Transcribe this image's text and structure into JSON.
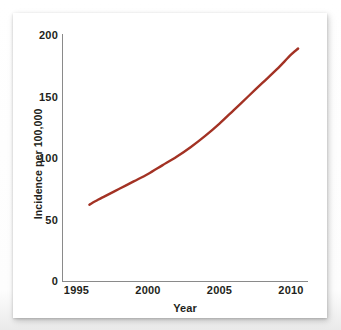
{
  "figure": {
    "background_color": "#ffffff",
    "card_color": "#ffffff",
    "axis_color": "#8a8a8a",
    "text_color": "#231f20"
  },
  "chart_data": {
    "type": "line",
    "title": "",
    "subtitle": "",
    "xlabel": "Year",
    "ylabel": "Incidence per 100,000",
    "xlim": [
      1995,
      2010.8
    ],
    "ylim": [
      0,
      200
    ],
    "xticks": [
      "1995",
      "2000",
      "2005",
      "2010"
    ],
    "xtick_values": [
      1995,
      2000,
      2005,
      2010
    ],
    "yticks": [
      "0",
      "50",
      "100",
      "150",
      "200"
    ],
    "ytick_values": [
      0,
      50,
      100,
      150,
      200
    ],
    "grid": false,
    "legend": null,
    "legend_position": "none",
    "series": [
      {
        "name": "Incidence",
        "color": "#a33224",
        "line_width": 2.4,
        "x": [
          1995.9,
          1996.5,
          1997,
          1998,
          1999,
          2000,
          2001,
          2002,
          2003,
          2004,
          2005,
          2006,
          2007,
          2008,
          2009,
          2010,
          2010.5
        ],
        "values": [
          62,
          66,
          69,
          75,
          81,
          87,
          94,
          101,
          109,
          118,
          128,
          139,
          150,
          161,
          172,
          184,
          189
        ]
      }
    ],
    "annotations": []
  }
}
